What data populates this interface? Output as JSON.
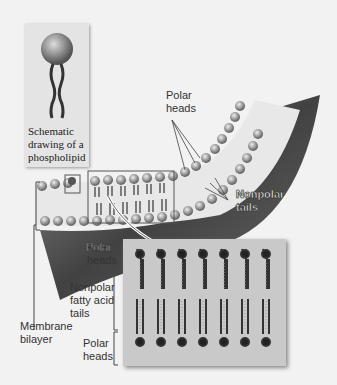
{
  "figure": {
    "inset_caption": "Schematic drawing of a phospholipid",
    "inset_caption_lines": [
      "Schematic",
      "drawing of a",
      "phospholipid"
    ],
    "labels": {
      "polar_heads_top": [
        "Polar",
        "heads"
      ],
      "nonpolar_tails": [
        "Nonpolar",
        "tails"
      ],
      "membrane_bilayer": [
        "Membrane",
        "bilayer"
      ],
      "detail_polar_heads_top": [
        "Polar",
        "heads"
      ],
      "detail_nonpolar_tails": [
        "Nonpolar",
        "fatty acid",
        "tails"
      ],
      "detail_polar_heads_bottom": [
        "Polar",
        "heads"
      ]
    },
    "colors": {
      "background": "#f2f2f2",
      "membrane_dark": "#3a3a3a",
      "head": "#8a8a8a",
      "tail": "#444444",
      "detail_box": "#c9c9c9"
    },
    "detail_molecule_pairs": 7
  }
}
